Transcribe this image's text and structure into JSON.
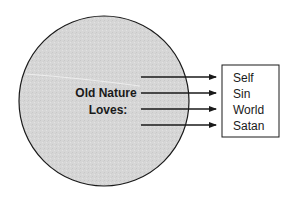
{
  "diagram": {
    "circle_label_lines": [
      "Old Nature",
      "Loves:"
    ],
    "targets": [
      "Self",
      "Sin",
      "World",
      "Satan"
    ],
    "colors": {
      "circle_fill": "#d6d6d6",
      "stroke": "#1a1a1a",
      "background": "#ffffff"
    }
  }
}
